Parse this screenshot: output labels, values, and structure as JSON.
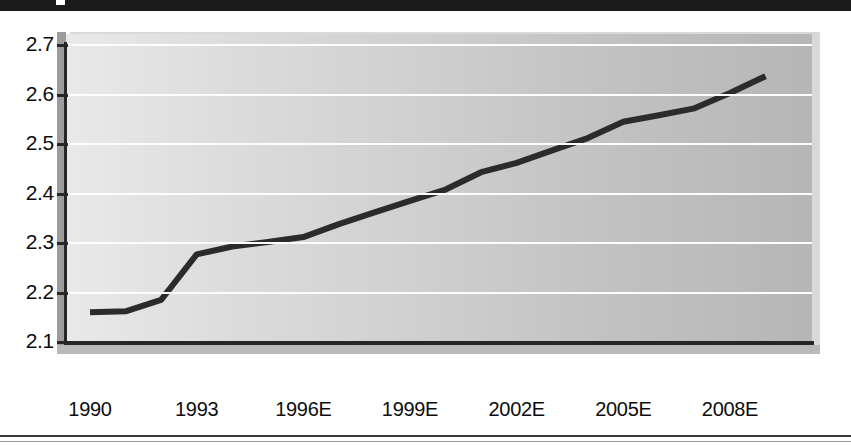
{
  "chart_data": {
    "type": "line",
    "title": "",
    "subtitle": "",
    "xlabel": "",
    "ylabel": "",
    "grid": true,
    "legend": false,
    "ylim": [
      2.1,
      2.7
    ],
    "ytick_labels": [
      "2.7",
      "2.6",
      "2.5",
      "2.4",
      "2.3",
      "2.2",
      "2.1"
    ],
    "ytick_values": [
      2.7,
      2.6,
      2.5,
      2.4,
      2.3,
      2.2,
      2.1
    ],
    "xtick_labels": [
      "1990",
      "1993",
      "1996E",
      "1999E",
      "2002E",
      "2005E",
      "2008E"
    ],
    "xtick_values": [
      1990,
      1993,
      1996,
      1999,
      2002,
      2005,
      2008
    ],
    "xlim": [
      1989.4,
      2009.6
    ],
    "x": [
      1990,
      1991,
      1992,
      1993,
      1994,
      1995,
      1996,
      1997,
      1998,
      1999,
      2000,
      2001,
      2002,
      2003,
      2004,
      2005,
      2006,
      2007,
      2008,
      2009
    ],
    "values": [
      2.16,
      2.162,
      2.185,
      2.277,
      2.293,
      2.302,
      2.312,
      2.338,
      2.362,
      2.385,
      2.408,
      2.443,
      2.462,
      2.487,
      2.512,
      2.545,
      2.558,
      2.572,
      2.603,
      2.637
    ],
    "series": [
      {
        "name": "",
        "color": "#2b2b2b",
        "line_width": 6,
        "values": [
          2.16,
          2.162,
          2.185,
          2.277,
          2.293,
          2.302,
          2.312,
          2.338,
          2.362,
          2.385,
          2.408,
          2.443,
          2.462,
          2.487,
          2.512,
          2.545,
          2.558,
          2.572,
          2.603,
          2.637
        ]
      }
    ],
    "colors": {
      "line": "#2b2b2b",
      "gridline": "#fdfdfd",
      "axis": "#262626",
      "plot_fill_left": "#e9e9e9",
      "plot_fill_right": "#b6b6b6",
      "page_background": "#ffffff",
      "band": "#1a1a1a"
    }
  },
  "axes": {
    "y_ticks": [
      {
        "label": "2.7",
        "value": 2.7
      },
      {
        "label": "2.6",
        "value": 2.6
      },
      {
        "label": "2.5",
        "value": 2.5
      },
      {
        "label": "2.4",
        "value": 2.4
      },
      {
        "label": "2.3",
        "value": 2.3
      },
      {
        "label": "2.2",
        "value": 2.2
      },
      {
        "label": "2.1",
        "value": 2.1
      }
    ],
    "x_ticks": [
      {
        "label": "1990",
        "value": 1990
      },
      {
        "label": "1993",
        "value": 1993
      },
      {
        "label": "1996E",
        "value": 1996
      },
      {
        "label": "1999E",
        "value": 1999
      },
      {
        "label": "2002E",
        "value": 2002
      },
      {
        "label": "2005E",
        "value": 2005
      },
      {
        "label": "2008E",
        "value": 2008
      }
    ]
  }
}
